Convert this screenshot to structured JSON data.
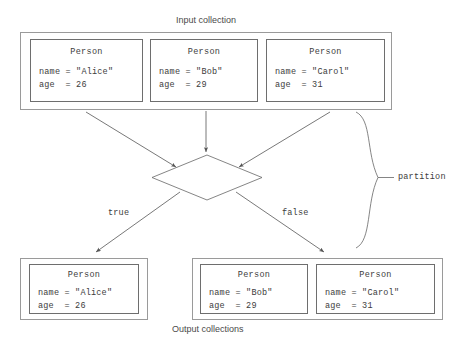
{
  "diagram": {
    "title_top": "Input collection",
    "title_bottom": "Output collections",
    "predicate": "p.age <= 27",
    "branch_true_label": "true",
    "branch_false_label": "false",
    "partition_label": "partition",
    "input_collection": {
      "name": "Input collection",
      "items": [
        {
          "type": "Person",
          "field1_key": "name",
          "field1_eq": "=",
          "field1_value": "\"Alice\"",
          "field2_key": "age ",
          "field2_eq": "=",
          "field2_value": "26",
          "line1": "name = \"Alice\"",
          "line2": "age  = 26"
        },
        {
          "type": "Person",
          "field1_key": "name",
          "field1_eq": "=",
          "field1_value": "\"Bob\"",
          "field2_key": "age ",
          "field2_eq": "=",
          "field2_value": "29",
          "line1": "name = \"Bob\"",
          "line2": "age  = 29"
        },
        {
          "type": "Person",
          "field1_key": "name",
          "field1_eq": "=",
          "field1_value": "\"Carol\"",
          "field2_key": "age ",
          "field2_eq": "=",
          "field2_value": "31",
          "line1": "name = \"Carol\"",
          "line2": "age  = 31"
        }
      ]
    },
    "output_true_collection": {
      "items": [
        {
          "type": "Person",
          "line1": "name = \"Alice\"",
          "line2": "age  = 26"
        }
      ]
    },
    "output_false_collection": {
      "items": [
        {
          "type": "Person",
          "line1": "name = \"Bob\"",
          "line2": "age  = 29"
        },
        {
          "type": "Person",
          "line1": "name = \"Carol\"",
          "line2": "age  = 31"
        }
      ]
    },
    "colors": {
      "outer_border": "#9a9a9a",
      "card_border": "#6e6e6e",
      "line": "#555555",
      "text": "#3c3c3c",
      "caption": "#4a4a4a",
      "background": "#ffffff"
    }
  }
}
